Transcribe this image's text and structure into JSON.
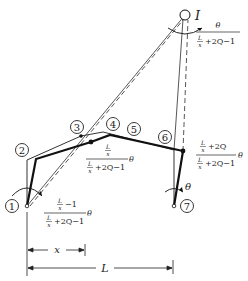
{
  "diagram": {
    "nodes": [
      {
        "id": "1",
        "label": "1"
      },
      {
        "id": "2",
        "label": "2"
      },
      {
        "id": "3",
        "label": "3"
      },
      {
        "id": "4",
        "label": "4"
      },
      {
        "id": "5",
        "label": "5"
      },
      {
        "id": "6",
        "label": "6"
      },
      {
        "id": "7",
        "label": "7"
      }
    ],
    "instant_center": {
      "label": "I"
    },
    "rotations": {
      "at_I": {
        "num": "θ",
        "den_frac_num": "L",
        "den_frac_den": "x",
        "den_rest": "+2Q−1"
      },
      "at_3": {
        "num_frac_num": "L",
        "num_frac_den": "x",
        "den_frac_num": "L",
        "den_frac_den": "x",
        "den_rest": "+2Q−1",
        "theta": "θ"
      },
      "at_6": {
        "num_frac_num": "L",
        "num_frac_den": "x",
        "num_rest": "+2Q",
        "den_frac_num": "L",
        "den_frac_den": "x",
        "den_rest": "+2Q−1",
        "theta": "θ"
      },
      "at_1": {
        "num_frac_num": "L",
        "num_frac_den": "x",
        "num_rest": "−1",
        "den_frac_num": "L",
        "den_frac_den": "x",
        "den_rest": "+2Q−1",
        "theta": "θ"
      },
      "at_7": {
        "theta": "θ"
      }
    },
    "dimensions": {
      "x": "x",
      "L": "L"
    }
  }
}
